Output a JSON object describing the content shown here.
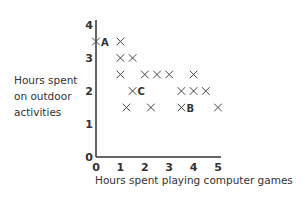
{
  "chart_data": {
    "type": "scatter",
    "title": "",
    "xlabel": "Hours spent playing computer games",
    "ylabel": [
      "Hours spent",
      "on outdoor",
      "activities"
    ],
    "xlim": [
      0,
      5
    ],
    "ylim": [
      0,
      4
    ],
    "xticks": [
      "0",
      "1",
      "2",
      "3",
      "4",
      "5"
    ],
    "yticks": [
      "0",
      "1",
      "2",
      "3",
      "4"
    ],
    "grid": false,
    "marker": "x",
    "points": [
      {
        "x": 0,
        "y": 3.5,
        "label": "A"
      },
      {
        "x": 1,
        "y": 3.5,
        "label": ""
      },
      {
        "x": 1,
        "y": 3,
        "label": ""
      },
      {
        "x": 1.5,
        "y": 3,
        "label": ""
      },
      {
        "x": 1,
        "y": 2.5,
        "label": ""
      },
      {
        "x": 2,
        "y": 2.5,
        "label": ""
      },
      {
        "x": 2.5,
        "y": 2.5,
        "label": ""
      },
      {
        "x": 3,
        "y": 2.5,
        "label": ""
      },
      {
        "x": 4,
        "y": 2.5,
        "label": ""
      },
      {
        "x": 1.5,
        "y": 2,
        "label": "C"
      },
      {
        "x": 3.5,
        "y": 2,
        "label": ""
      },
      {
        "x": 4,
        "y": 2,
        "label": ""
      },
      {
        "x": 4.5,
        "y": 2,
        "label": ""
      },
      {
        "x": 1.25,
        "y": 1.5,
        "label": ""
      },
      {
        "x": 2.25,
        "y": 1.5,
        "label": ""
      },
      {
        "x": 3.5,
        "y": 1.5,
        "label": "B"
      },
      {
        "x": 5,
        "y": 1.5,
        "label": ""
      }
    ]
  },
  "colors": {
    "marker": "#444444",
    "axis": "#333333",
    "text": "#333333"
  }
}
